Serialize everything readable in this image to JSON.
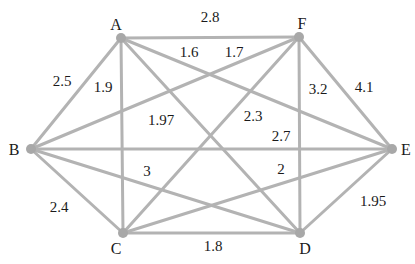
{
  "diagram": {
    "type": "weighted-complete-graph",
    "edge_color": "#b3b3b3",
    "node_color": "#a8a8a8",
    "text_color": "#1a1a1a",
    "nodes": [
      {
        "id": "A",
        "label": "A",
        "x": 121,
        "y": 38,
        "lx": 116,
        "ly": 30,
        "anchor": "middle"
      },
      {
        "id": "F",
        "label": "F",
        "x": 299,
        "y": 37,
        "lx": 302,
        "ly": 29,
        "anchor": "middle"
      },
      {
        "id": "B",
        "label": "B",
        "x": 31,
        "y": 149,
        "lx": 14,
        "ly": 155,
        "anchor": "middle"
      },
      {
        "id": "E",
        "label": "E",
        "x": 392,
        "y": 149,
        "lx": 406,
        "ly": 155,
        "anchor": "middle"
      },
      {
        "id": "C",
        "label": "C",
        "x": 123,
        "y": 233,
        "lx": 116,
        "ly": 254,
        "anchor": "middle"
      },
      {
        "id": "D",
        "label": "D",
        "x": 300,
        "y": 233,
        "lx": 305,
        "ly": 254,
        "anchor": "middle"
      }
    ],
    "edges": [
      {
        "from": "A",
        "to": "F",
        "weight": "2.8",
        "lx": 210,
        "ly": 22
      },
      {
        "from": "A",
        "to": "B",
        "weight": "2.5",
        "lx": 62,
        "ly": 86
      },
      {
        "from": "A",
        "to": "C",
        "weight": "1.9",
        "lx": 103,
        "ly": 92
      },
      {
        "from": "A",
        "to": "E",
        "weight": "1.6",
        "lx": 189,
        "ly": 57
      },
      {
        "from": "A",
        "to": "D",
        "weight": "1.97",
        "lx": 161,
        "ly": 125
      },
      {
        "from": "F",
        "to": "B",
        "weight": "1.7",
        "lx": 234,
        "ly": 57
      },
      {
        "from": "F",
        "to": "C",
        "weight": "2.3",
        "lx": 253,
        "ly": 121
      },
      {
        "from": "F",
        "to": "D",
        "weight": "3.2",
        "lx": 318,
        "ly": 94
      },
      {
        "from": "F",
        "to": "E",
        "weight": "4.1",
        "lx": 364,
        "ly": 92
      },
      {
        "from": "B",
        "to": "E",
        "weight": "2.7",
        "lx": 281,
        "ly": 141
      },
      {
        "from": "B",
        "to": "D",
        "weight": "3",
        "lx": 147,
        "ly": 176
      },
      {
        "from": "B",
        "to": "C",
        "weight": "2.4",
        "lx": 59,
        "ly": 212
      },
      {
        "from": "C",
        "to": "E",
        "weight": "2",
        "lx": 281,
        "ly": 174
      },
      {
        "from": "C",
        "to": "D",
        "weight": "1.8",
        "lx": 213,
        "ly": 251
      },
      {
        "from": "D",
        "to": "E",
        "weight": "1.95",
        "lx": 373,
        "ly": 206
      }
    ]
  }
}
